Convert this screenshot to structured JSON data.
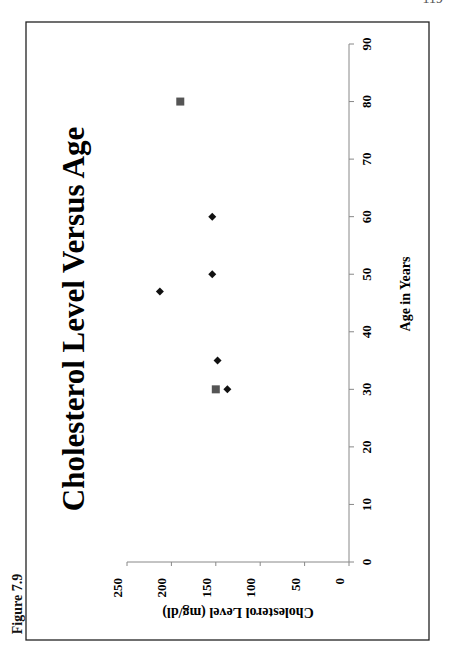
{
  "page": {
    "page_number": "119",
    "figure_label": "Figure 7.9"
  },
  "chart_data": {
    "type": "scatter",
    "title": "Cholesterol Level Versus Age",
    "xlabel": "Age in Years",
    "ylabel": "Cholesterol Level (mg/dl)",
    "xlim": [
      0,
      90
    ],
    "ylim": [
      0,
      250
    ],
    "x_ticks": [
      0,
      10,
      20,
      30,
      40,
      50,
      60,
      70,
      80,
      90
    ],
    "y_ticks": [
      0,
      50,
      100,
      150,
      200,
      250
    ],
    "grid": false,
    "legend": null,
    "orientation": "rotated 90° counter-clockwise on page",
    "series": [
      {
        "name": "diamond points",
        "marker": "diamond",
        "color": "#111111",
        "points": [
          {
            "x": 30,
            "y": 137
          },
          {
            "x": 35,
            "y": 148
          },
          {
            "x": 47,
            "y": 213
          },
          {
            "x": 50,
            "y": 154
          },
          {
            "x": 60,
            "y": 154
          }
        ]
      },
      {
        "name": "square points",
        "marker": "square",
        "color": "#555555",
        "points": [
          {
            "x": 30,
            "y": 150
          },
          {
            "x": 80,
            "y": 190
          }
        ]
      }
    ]
  }
}
